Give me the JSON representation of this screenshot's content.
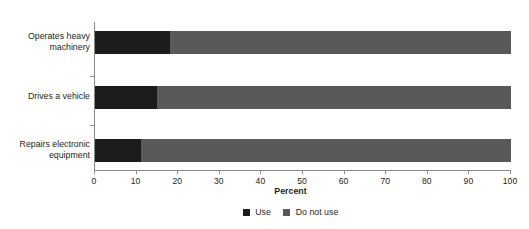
{
  "chart_data": {
    "type": "bar",
    "orientation": "horizontal",
    "stacked": true,
    "stacked_total": 100,
    "title": "Figure 2. Use of electronic devices among workers by selected task type",
    "xlabel": "Percent",
    "ylabel": "",
    "xlim": [
      0,
      100
    ],
    "xticks": [
      0,
      10,
      20,
      30,
      40,
      50,
      60,
      70,
      80,
      90,
      100
    ],
    "grid": false,
    "legend_position": "bottom",
    "categories": [
      "Operates heavy machinery",
      "Drives a vehicle",
      "Repairs electronic equipment"
    ],
    "category_lines": [
      [
        "Operates heavy",
        "machinery"
      ],
      [
        "Drives a vehicle"
      ],
      [
        "Repairs electronic",
        "equipment"
      ]
    ],
    "series": [
      {
        "name": "Use",
        "color": "#1c1c1c",
        "values": [
          18,
          15,
          11
        ]
      },
      {
        "name": "Do not use",
        "color": "#595959",
        "values": [
          82,
          85,
          89
        ]
      }
    ]
  },
  "legend": {
    "items": [
      {
        "label": "Use",
        "swatch": "#1c1c1c"
      },
      {
        "label": "Do not use",
        "swatch": "#595959"
      }
    ]
  }
}
